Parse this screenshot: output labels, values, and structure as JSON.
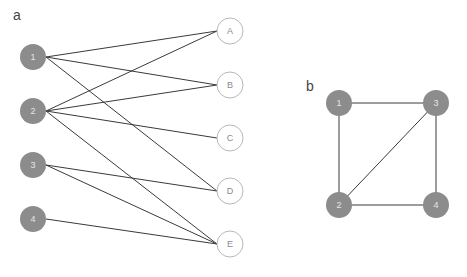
{
  "panels": [
    {
      "label": "a",
      "label_pos": [
        13,
        20
      ],
      "type": "bipartite",
      "left_nodes": [
        {
          "id": "1",
          "x": 33,
          "y": 57
        },
        {
          "id": "2",
          "x": 33,
          "y": 111
        },
        {
          "id": "3",
          "x": 33,
          "y": 165
        },
        {
          "id": "4",
          "x": 33,
          "y": 219
        }
      ],
      "right_nodes": [
        {
          "id": "A",
          "x": 230,
          "y": 31
        },
        {
          "id": "B",
          "x": 230,
          "y": 85
        },
        {
          "id": "C",
          "x": 230,
          "y": 138
        },
        {
          "id": "D",
          "x": 230,
          "y": 191
        },
        {
          "id": "E",
          "x": 230,
          "y": 244
        }
      ],
      "edges": [
        [
          "1",
          "A"
        ],
        [
          "1",
          "B"
        ],
        [
          "1",
          "D"
        ],
        [
          "2",
          "A"
        ],
        [
          "2",
          "B"
        ],
        [
          "2",
          "C"
        ],
        [
          "2",
          "E"
        ],
        [
          "3",
          "D"
        ],
        [
          "3",
          "E"
        ],
        [
          "4",
          "E"
        ]
      ]
    },
    {
      "label": "b",
      "label_pos": [
        306,
        91
      ],
      "type": "graph",
      "nodes": [
        {
          "id": "1",
          "x": 339,
          "y": 103
        },
        {
          "id": "3",
          "x": 436,
          "y": 103
        },
        {
          "id": "2",
          "x": 339,
          "y": 205
        },
        {
          "id": "4",
          "x": 436,
          "y": 205
        }
      ],
      "edges": [
        [
          "1",
          "3"
        ],
        [
          "1",
          "2"
        ],
        [
          "2",
          "3"
        ],
        [
          "3",
          "4"
        ],
        [
          "2",
          "4"
        ]
      ]
    }
  ],
  "style": {
    "node_radius": 13,
    "filled_color": "#8c8c8c",
    "outline_color": "#b8b8b8",
    "edge_color": "#3a3a3a"
  }
}
